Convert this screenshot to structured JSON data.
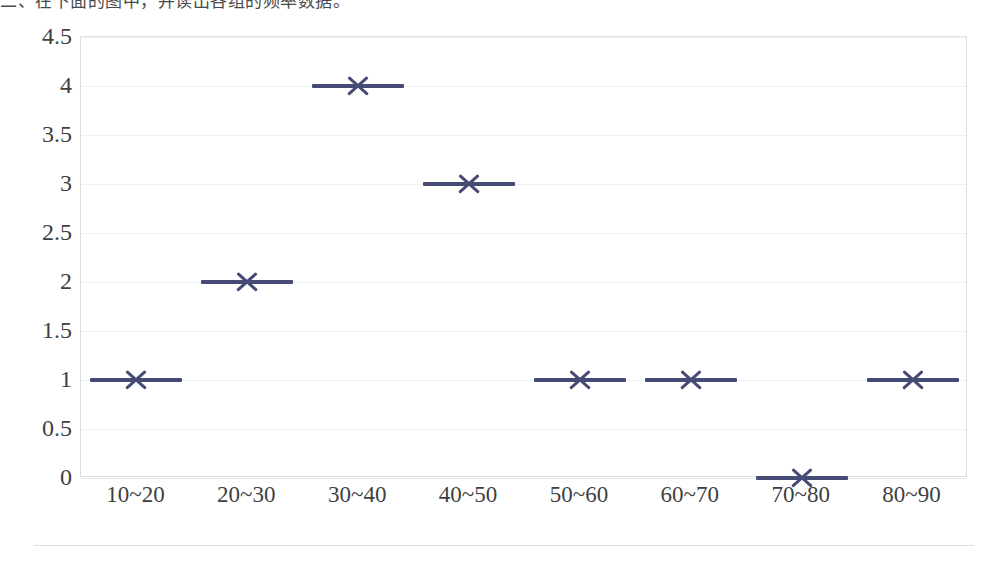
{
  "header": {
    "text": "二、在下面的图中，并读出各组的频率数据。"
  },
  "colors": {
    "marker": "#454b74",
    "gridline": "#eef1f4",
    "plot_border": "#dcdcdc",
    "axis_text": "#3f3f3f",
    "outer_rule": "#d9dde2",
    "background": "#ffffff"
  },
  "chart_data": {
    "type": "scatter",
    "title": "",
    "subtitle": "",
    "xlabel": "",
    "ylabel": "",
    "categories": [
      "10~20",
      "20~30",
      "30~40",
      "40~50",
      "50~60",
      "60~70",
      "70~80",
      "80~90"
    ],
    "values": [
      1,
      2,
      4,
      3,
      1,
      1,
      0,
      1
    ],
    "series": [
      {
        "name": "",
        "values": [
          1,
          2,
          4,
          3,
          1,
          1,
          0,
          1
        ]
      }
    ],
    "ylim": [
      0,
      4.5
    ],
    "ytick_labels": [
      "4.5",
      "4",
      "3.5",
      "3",
      "2.5",
      "2",
      "1.5",
      "1",
      "0.5",
      "0"
    ],
    "ytick_values": [
      4.5,
      4,
      3.5,
      3,
      2.5,
      2,
      1.5,
      1,
      0.5,
      0
    ],
    "ystep": 0.5,
    "grid": true,
    "grid_axis": "y",
    "legend": false,
    "legend_position": "none",
    "marker_style": "x",
    "annotations": []
  }
}
